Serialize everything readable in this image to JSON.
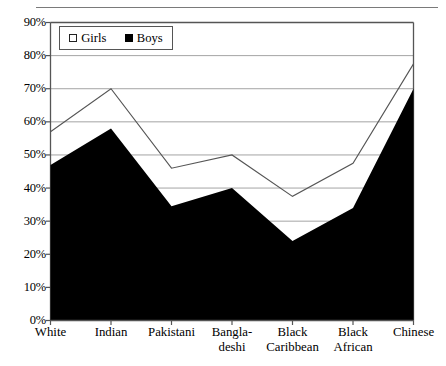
{
  "chart_data": {
    "type": "area",
    "title": "",
    "subtitle": "",
    "xlabel": "",
    "ylabel": "",
    "ylim": [
      0,
      90
    ],
    "ytick_labels": [
      "0%",
      "10%",
      "20%",
      "30%",
      "40%",
      "50%",
      "60%",
      "70%",
      "80%",
      "90%"
    ],
    "ytick_values": [
      0,
      10,
      20,
      30,
      40,
      50,
      60,
      70,
      80,
      90
    ],
    "grid": "horizontal",
    "legend_position": "top-left-inside",
    "categories": [
      "White",
      "Indian",
      "Pakistani",
      "Bangla-\ndeshi",
      "Black\nCaribbean",
      "Black\nAfrican",
      "Chinese"
    ],
    "series": [
      {
        "name": "Girls",
        "style": "line",
        "color": "#555555",
        "values": [
          57,
          70,
          46,
          50,
          37.5,
          47.5,
          77.5
        ]
      },
      {
        "name": "Boys",
        "style": "filled-area",
        "color": "#000000",
        "values": [
          47,
          58,
          34.5,
          40,
          24,
          34,
          70
        ]
      }
    ],
    "annotations": []
  },
  "legend": {
    "girls": {
      "label": "Girls",
      "swatch": "open-square-icon",
      "color": "#ffffff"
    },
    "boys": {
      "label": "Boys",
      "swatch": "filled-square-icon",
      "color": "#000000"
    }
  },
  "axes": {
    "y_labels": [
      "90%",
      "80%",
      "70%",
      "60%",
      "50%",
      "40%",
      "30%",
      "20%",
      "10%",
      "0%"
    ],
    "x_labels": [
      "White",
      "Indian",
      "Pakistani",
      "Bangla-\ndeshi",
      "Black\nCaribbean",
      "Black\nAfrican",
      "Chinese"
    ]
  },
  "colors": {
    "frame": "#555555",
    "grid": "#9a9a9a",
    "girls_line": "#555555",
    "boys_fill": "#000000",
    "rule": "#7a7a7a",
    "background": "#ffffff"
  }
}
